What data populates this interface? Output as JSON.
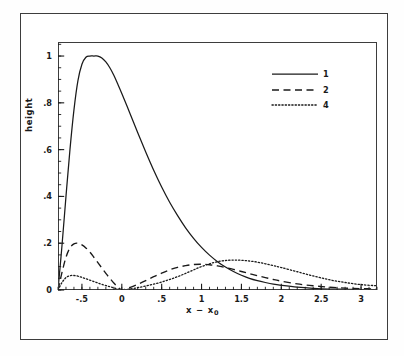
{
  "chart_data": {
    "type": "line",
    "title": "",
    "xlabel": "x − x₀",
    "ylabel": "height",
    "xlim": [
      -0.8,
      3.2
    ],
    "ylim": [
      0,
      1.06
    ],
    "grid": false,
    "legend_position": "top-right",
    "x_ticks": [
      {
        "value": -0.5,
        "label": "-.5"
      },
      {
        "value": 0,
        "label": "0"
      },
      {
        "value": 0.5,
        "label": ".5"
      },
      {
        "value": 1.0,
        "label": "1"
      },
      {
        "value": 1.5,
        "label": "1.5"
      },
      {
        "value": 2.0,
        "label": "2"
      },
      {
        "value": 2.5,
        "label": "2.5"
      },
      {
        "value": 3.0,
        "label": "3"
      }
    ],
    "x_minor_step": 0.1,
    "y_ticks": [
      {
        "value": 0,
        "label": "0"
      },
      {
        "value": 0.2,
        "label": ".2"
      },
      {
        "value": 0.4,
        "label": ".4"
      },
      {
        "value": 0.6,
        "label": ".6"
      },
      {
        "value": 0.8,
        "label": ".8"
      },
      {
        "value": 1.0,
        "label": "1"
      }
    ],
    "y_minor_step": 0.05,
    "series": [
      {
        "name": "1",
        "dash": "solid",
        "peak_x": -0.3,
        "peak_y": 1.0,
        "x": [
          -0.8,
          -0.75,
          -0.7,
          -0.65,
          -0.6,
          -0.55,
          -0.5,
          -0.45,
          -0.4,
          -0.35,
          -0.3,
          -0.25,
          -0.2,
          -0.15,
          -0.1,
          -0.05,
          0.0,
          0.1,
          0.2,
          0.3,
          0.4,
          0.5,
          0.6,
          0.7,
          0.8,
          0.9,
          1.0,
          1.1,
          1.2,
          1.3,
          1.4,
          1.5,
          1.6,
          1.7,
          1.8,
          1.9,
          2.0,
          2.2,
          2.4,
          2.6,
          2.8,
          3.0,
          3.2
        ],
        "y": [
          0.0,
          0.19,
          0.4,
          0.6,
          0.77,
          0.895,
          0.965,
          0.995,
          1.0,
          1.0,
          1.0,
          0.992,
          0.975,
          0.95,
          0.918,
          0.88,
          0.84,
          0.757,
          0.672,
          0.59,
          0.512,
          0.44,
          0.375,
          0.318,
          0.266,
          0.221,
          0.182,
          0.149,
          0.121,
          0.098,
          0.079,
          0.063,
          0.05,
          0.04,
          0.032,
          0.025,
          0.02,
          0.012,
          0.007,
          0.004,
          0.003,
          0.002,
          0.001
        ]
      },
      {
        "name": "2",
        "dash": "dashed",
        "peak_x": -0.55,
        "peak_y": 0.2,
        "second_peak_x": 0.95,
        "second_peak_y": 0.11,
        "node_x": 0.0,
        "x": [
          -0.8,
          -0.75,
          -0.7,
          -0.65,
          -0.6,
          -0.55,
          -0.5,
          -0.45,
          -0.4,
          -0.35,
          -0.3,
          -0.25,
          -0.2,
          -0.15,
          -0.1,
          -0.05,
          0.0,
          0.05,
          0.1,
          0.2,
          0.3,
          0.4,
          0.5,
          0.6,
          0.7,
          0.8,
          0.9,
          1.0,
          1.1,
          1.2,
          1.3,
          1.4,
          1.5,
          1.6,
          1.7,
          1.8,
          1.9,
          2.0,
          2.2,
          2.4,
          2.6,
          2.8,
          3.0,
          3.2
        ],
        "y": [
          0.0,
          0.075,
          0.14,
          0.18,
          0.197,
          0.2,
          0.193,
          0.18,
          0.162,
          0.14,
          0.117,
          0.094,
          0.071,
          0.05,
          0.03,
          0.013,
          0.0,
          0.004,
          0.01,
          0.024,
          0.04,
          0.057,
          0.072,
          0.086,
          0.097,
          0.104,
          0.109,
          0.11,
          0.108,
          0.103,
          0.096,
          0.088,
          0.079,
          0.07,
          0.061,
          0.053,
          0.045,
          0.038,
          0.026,
          0.018,
          0.012,
          0.008,
          0.006,
          0.004
        ]
      },
      {
        "name": "4",
        "dash": "dotted",
        "peak_x": -0.62,
        "peak_y": 0.062,
        "second_peak_x": 1.45,
        "second_peak_y": 0.128,
        "node_x": 0.0,
        "x": [
          -0.8,
          -0.75,
          -0.7,
          -0.65,
          -0.6,
          -0.55,
          -0.5,
          -0.45,
          -0.4,
          -0.35,
          -0.3,
          -0.25,
          -0.2,
          -0.15,
          -0.1,
          -0.05,
          0.0,
          0.05,
          0.1,
          0.2,
          0.3,
          0.4,
          0.5,
          0.6,
          0.7,
          0.8,
          0.9,
          1.0,
          1.1,
          1.2,
          1.3,
          1.4,
          1.5,
          1.6,
          1.7,
          1.8,
          1.9,
          2.0,
          2.2,
          2.4,
          2.6,
          2.8,
          3.0,
          3.2
        ],
        "y": [
          0.0,
          0.032,
          0.053,
          0.061,
          0.062,
          0.059,
          0.054,
          0.048,
          0.042,
          0.036,
          0.03,
          0.024,
          0.019,
          0.014,
          0.009,
          0.004,
          0.0,
          0.002,
          0.004,
          0.01,
          0.017,
          0.025,
          0.034,
          0.045,
          0.057,
          0.071,
          0.086,
          0.1,
          0.112,
          0.121,
          0.126,
          0.128,
          0.127,
          0.124,
          0.119,
          0.112,
          0.104,
          0.096,
          0.078,
          0.06,
          0.044,
          0.032,
          0.023,
          0.018
        ]
      }
    ]
  },
  "legend": {
    "entries": [
      {
        "label": "1",
        "style": "solid"
      },
      {
        "label": "2",
        "style": "dashed"
      },
      {
        "label": "4",
        "style": "dotted"
      }
    ]
  }
}
